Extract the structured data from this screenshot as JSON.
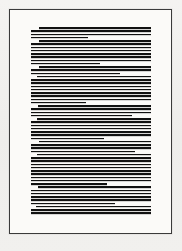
{
  "document": {
    "kind": "scanned-page-thumbnail",
    "page_width": 182,
    "page_height": 251,
    "surround_color": "#f2f1ef",
    "sheet_color": "#fbfaf8",
    "rule_color": "#3a3a3a",
    "ink_color": "#111111",
    "legibility_note": "Body text is rendered below glyph-resolution; each text line appears as a solid horizontal bar.",
    "sheet": {
      "x": 9,
      "y": 9,
      "width": 163,
      "height": 225
    },
    "text_block": {
      "left": 30,
      "right": 150,
      "top": 26,
      "bottom": 213,
      "column_width": 120,
      "line_pitch": 3.25,
      "line_thickness": 1.7,
      "line_count": 58,
      "paragraph_count": 9
    },
    "lines": [
      {
        "indent": 8,
        "width": 112,
        "role": "paragraph-first"
      },
      {
        "indent": 0,
        "width": 120,
        "role": "body"
      },
      {
        "indent": 0,
        "width": 120,
        "role": "body"
      },
      {
        "indent": 0,
        "width": 57,
        "role": "paragraph-last"
      },
      {
        "indent": 8,
        "width": 112,
        "role": "paragraph-first"
      },
      {
        "indent": 0,
        "width": 120,
        "role": "body"
      },
      {
        "indent": 0,
        "width": 120,
        "role": "body"
      },
      {
        "indent": 0,
        "width": 120,
        "role": "body"
      },
      {
        "indent": 0,
        "width": 120,
        "role": "body"
      },
      {
        "indent": 0,
        "width": 120,
        "role": "body"
      },
      {
        "indent": 0,
        "width": 120,
        "role": "body"
      },
      {
        "indent": 0,
        "width": 69,
        "role": "paragraph-last"
      },
      {
        "indent": 8,
        "width": 112,
        "role": "paragraph-first"
      },
      {
        "indent": 0,
        "width": 120,
        "role": "body"
      },
      {
        "indent": 0,
        "width": 89,
        "role": "paragraph-last"
      },
      {
        "indent": 6,
        "width": 114,
        "role": "paragraph-first"
      },
      {
        "indent": 0,
        "width": 120,
        "role": "body"
      },
      {
        "indent": 0,
        "width": 120,
        "role": "body"
      },
      {
        "indent": 0,
        "width": 120,
        "role": "body"
      },
      {
        "indent": 0,
        "width": 120,
        "role": "body"
      },
      {
        "indent": 0,
        "width": 120,
        "role": "body"
      },
      {
        "indent": 0,
        "width": 120,
        "role": "body"
      },
      {
        "indent": 0,
        "width": 120,
        "role": "body"
      },
      {
        "indent": 0,
        "width": 55,
        "role": "paragraph-last"
      },
      {
        "indent": 7,
        "width": 113,
        "role": "paragraph-first"
      },
      {
        "indent": 0,
        "width": 120,
        "role": "body"
      },
      {
        "indent": 0,
        "width": 120,
        "role": "body"
      },
      {
        "indent": 0,
        "width": 101,
        "role": "paragraph-last"
      },
      {
        "indent": 6,
        "width": 114,
        "role": "paragraph-first"
      },
      {
        "indent": 0,
        "width": 120,
        "role": "body"
      },
      {
        "indent": 0,
        "width": 120,
        "role": "body"
      },
      {
        "indent": 0,
        "width": 120,
        "role": "body"
      },
      {
        "indent": 0,
        "width": 120,
        "role": "body"
      },
      {
        "indent": 0,
        "width": 120,
        "role": "body"
      },
      {
        "indent": 0,
        "width": 73,
        "role": "paragraph-last"
      },
      {
        "indent": 8,
        "width": 112,
        "role": "paragraph-first"
      },
      {
        "indent": 0,
        "width": 120,
        "role": "body"
      },
      {
        "indent": 0,
        "width": 120,
        "role": "body"
      },
      {
        "indent": 0,
        "width": 104,
        "role": "paragraph-last"
      },
      {
        "indent": 6,
        "width": 114,
        "role": "paragraph-first"
      },
      {
        "indent": 0,
        "width": 120,
        "role": "body"
      },
      {
        "indent": 0,
        "width": 120,
        "role": "body"
      },
      {
        "indent": 0,
        "width": 120,
        "role": "body"
      },
      {
        "indent": 0,
        "width": 120,
        "role": "body"
      },
      {
        "indent": 0,
        "width": 120,
        "role": "body"
      },
      {
        "indent": 0,
        "width": 120,
        "role": "body"
      },
      {
        "indent": 0,
        "width": 120,
        "role": "body"
      },
      {
        "indent": 0,
        "width": 120,
        "role": "body"
      },
      {
        "indent": 0,
        "width": 76,
        "role": "paragraph-last"
      },
      {
        "indent": 7,
        "width": 113,
        "role": "paragraph-first"
      },
      {
        "indent": 0,
        "width": 120,
        "role": "body"
      },
      {
        "indent": 0,
        "width": 120,
        "role": "body"
      },
      {
        "indent": 0,
        "width": 120,
        "role": "body"
      },
      {
        "indent": 0,
        "width": 120,
        "role": "body"
      },
      {
        "indent": 0,
        "width": 84,
        "role": "paragraph-last"
      },
      {
        "indent": 5,
        "width": 115,
        "role": "paragraph-first"
      },
      {
        "indent": 0,
        "width": 120,
        "role": "body"
      },
      {
        "indent": 0,
        "width": 120,
        "role": "body"
      }
    ]
  }
}
